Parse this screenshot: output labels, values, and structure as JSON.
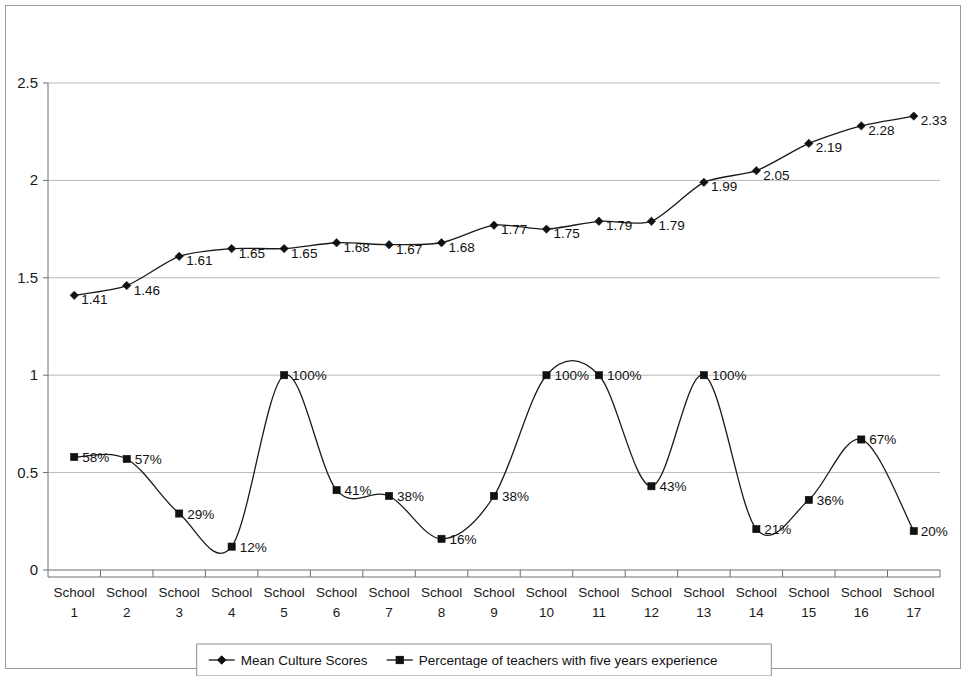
{
  "chart_data": {
    "type": "line",
    "title": "",
    "subtitle": "",
    "xlabel": "",
    "ylabel": "",
    "categories": [
      "School 1",
      "School 2",
      "School 3",
      "School 4",
      "School 5",
      "School 6",
      "School 7",
      "School 8",
      "School 9",
      "School 10",
      "School 11",
      "School 12",
      "School 13",
      "School 14",
      "School 15",
      "School 16",
      "School 17"
    ],
    "category_lines": [
      [
        "School",
        "1"
      ],
      [
        "School",
        "2"
      ],
      [
        "School",
        "3"
      ],
      [
        "School",
        "4"
      ],
      [
        "School",
        "5"
      ],
      [
        "School",
        "6"
      ],
      [
        "School",
        "7"
      ],
      [
        "School",
        "8"
      ],
      [
        "School",
        "9"
      ],
      [
        "School",
        "10"
      ],
      [
        "School",
        "11"
      ],
      [
        "School",
        "12"
      ],
      [
        "School",
        "13"
      ],
      [
        "School",
        "14"
      ],
      [
        "School",
        "15"
      ],
      [
        "School",
        "16"
      ],
      [
        "School",
        "17"
      ]
    ],
    "ylim": [
      0,
      2.5
    ],
    "yticks": [
      0,
      0.5,
      1,
      1.5,
      2,
      2.5
    ],
    "ytick_labels": [
      "0",
      "0.5",
      "1",
      "1.5",
      "2",
      "2.5"
    ],
    "grid": true,
    "grid_axis": "y",
    "legend_position": "bottom",
    "smooth": true,
    "series": [
      {
        "name": "Mean Culture Scores",
        "marker": "diamond",
        "color": "#111111",
        "values": [
          1.41,
          1.46,
          1.61,
          1.65,
          1.65,
          1.68,
          1.67,
          1.68,
          1.77,
          1.75,
          1.79,
          1.79,
          1.99,
          2.05,
          2.19,
          2.28,
          2.33
        ],
        "labels": [
          "1.41",
          "1.46",
          "1.61",
          "1.65",
          "1.65",
          "1.68",
          "1.67",
          "1.68",
          "1.77",
          "1.75",
          "1.79",
          "1.79",
          "1.99",
          "2.05",
          "2.19",
          "2.28",
          "2.33"
        ]
      },
      {
        "name": "Percentage of teachers with five years experience",
        "marker": "square",
        "color": "#111111",
        "values": [
          0.58,
          0.57,
          0.29,
          0.12,
          1.0,
          0.41,
          0.38,
          0.16,
          0.38,
          1.0,
          1.0,
          0.43,
          1.0,
          0.21,
          0.36,
          0.67,
          0.2
        ],
        "labels": [
          "58%",
          "57%",
          "29%",
          "12%",
          "100%",
          "41%",
          "38%",
          "16%",
          "38%",
          "100%",
          "100%",
          "43%",
          "100%",
          "21%",
          "36%",
          "67%",
          "20%"
        ]
      }
    ]
  },
  "legend": {
    "items": [
      {
        "label": "Mean Culture Scores",
        "marker": "diamond"
      },
      {
        "label": "Percentage of teachers with five years experience",
        "marker": "square"
      }
    ]
  }
}
